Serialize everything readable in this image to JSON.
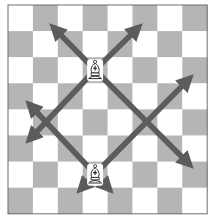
{
  "diagram": {
    "type": "chess-board",
    "board": {
      "files": 8,
      "ranks": 8,
      "top_left_color": "light",
      "light_color": "#ffffff",
      "dark_color": "#b5b5b5",
      "border_color": "#6e6e6e",
      "origin_x": 8,
      "origin_y": 5,
      "square_w": 24.9,
      "square_h": 26.1
    },
    "pieces": [
      {
        "name": "bishop",
        "color": "white",
        "col": 3,
        "row": 2
      },
      {
        "name": "bishop",
        "color": "white",
        "col": 3,
        "row": 6
      }
    ],
    "arrow_color": "#5c5c5c",
    "arrows": [
      {
        "from": [
          95,
          70
        ],
        "to": [
          53,
          27
        ]
      },
      {
        "from": [
          95,
          70
        ],
        "to": [
          139,
          27
        ]
      },
      {
        "from": [
          95,
          70
        ],
        "to": [
          29,
          140
        ]
      },
      {
        "from": [
          95,
          70
        ],
        "to": [
          190,
          165
        ]
      },
      {
        "from": [
          95,
          174
        ],
        "to": [
          29,
          104
        ]
      },
      {
        "from": [
          95,
          174
        ],
        "to": [
          190,
          78
        ]
      },
      {
        "from": [
          95,
          174
        ],
        "to": [
          80,
          190
        ]
      },
      {
        "from": [
          95,
          174
        ],
        "to": [
          110,
          190
        ]
      }
    ]
  }
}
